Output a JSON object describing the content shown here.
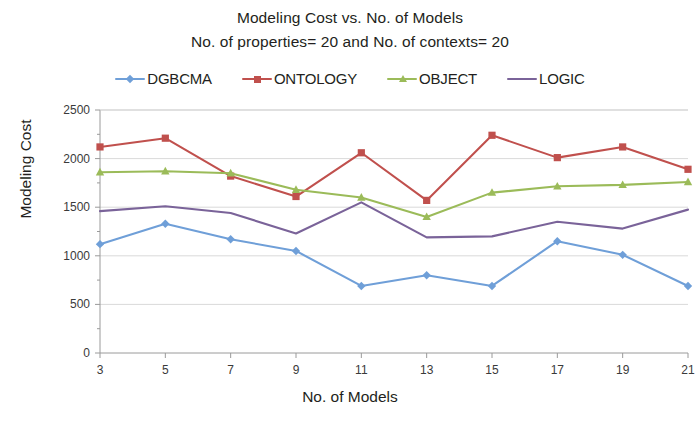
{
  "title": {
    "line1": "Modeling Cost vs. No. of Models",
    "line2": "No. of properties= 20 and  No. of contexts=  20"
  },
  "legend": {
    "position": "top",
    "items": [
      {
        "label": "DGBCMA",
        "color": "#6f9fd8",
        "marker": "diamond"
      },
      {
        "label": "ONTOLOGY",
        "color": "#c0504d",
        "marker": "square"
      },
      {
        "label": "OBJECT",
        "color": "#9bbb59",
        "marker": "triangle"
      },
      {
        "label": "LOGIC",
        "color": "#7a6399",
        "marker": "none"
      }
    ]
  },
  "axes": {
    "x_title": "No. of Models",
    "y_title": "Modeling Cost",
    "x_ticks": [
      "3",
      "5",
      "7",
      "9",
      "11",
      "13",
      "15",
      "17",
      "19",
      "21"
    ],
    "y_ticks": [
      "0",
      "500",
      "1000",
      "1500",
      "2000",
      "2500"
    ]
  },
  "chart_data": {
    "type": "line",
    "title": "Modeling Cost vs. No. of Models",
    "subtitle": "No. of properties= 20 and  No. of contexts=  20",
    "xlabel": "No. of Models",
    "ylabel": "Modeling Cost",
    "categories": [
      3,
      5,
      7,
      9,
      11,
      13,
      15,
      17,
      19,
      21
    ],
    "xlim": [
      3,
      21
    ],
    "ylim": [
      0,
      2500
    ],
    "ytick_step": 500,
    "grid": true,
    "legend_position": "top",
    "series": [
      {
        "name": "DGBCMA",
        "color": "#6f9fd8",
        "marker": "diamond",
        "values": [
          1120,
          1330,
          1170,
          1050,
          690,
          800,
          690,
          1150,
          1010,
          690
        ]
      },
      {
        "name": "ONTOLOGY",
        "color": "#c0504d",
        "marker": "square",
        "values": [
          2120,
          2210,
          1820,
          1610,
          2060,
          1570,
          2240,
          2010,
          2120,
          1890
        ]
      },
      {
        "name": "OBJECT",
        "color": "#9bbb59",
        "marker": "triangle",
        "values": [
          1860,
          1870,
          1850,
          1680,
          1600,
          1400,
          1650,
          1715,
          1730,
          1760
        ]
      },
      {
        "name": "LOGIC",
        "color": "#7a6399",
        "marker": "none",
        "values": [
          1460,
          1510,
          1440,
          1230,
          1550,
          1190,
          1200,
          1350,
          1280,
          1475
        ]
      }
    ]
  }
}
